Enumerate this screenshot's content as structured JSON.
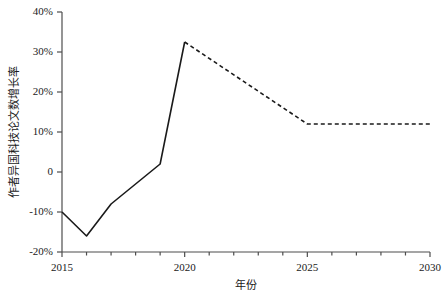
{
  "chart_data": {
    "type": "line",
    "title": "",
    "xlabel": "年份",
    "ylabel": "作者异国科技论文数增长率",
    "xlim": [
      2015,
      2030
    ],
    "ylim": [
      -20,
      40
    ],
    "grid": false,
    "legend": "none",
    "background_color": "#ffffff",
    "line_color": "#1a1a1a",
    "axis_color": "#4d4d4d",
    "xticks": [
      2015,
      2020,
      2025,
      2030
    ],
    "xtick_labels": [
      "2015",
      "2020",
      "2025",
      "2030"
    ],
    "xminor_tick_step": 1,
    "yticks": [
      -20,
      -10,
      0,
      10,
      20,
      30,
      40
    ],
    "ytick_labels": [
      "-20%",
      "-10%",
      "0",
      "10%",
      "20%",
      "30%",
      "40%"
    ],
    "series": [
      {
        "name": "历史",
        "style": "solid",
        "x": [
          2015,
          2016,
          2017,
          2019,
          2020
        ],
        "values": [
          -10,
          -16,
          -8,
          2,
          32.5
        ]
      },
      {
        "name": "预测",
        "style": "dashed",
        "x": [
          2020,
          2025,
          2030
        ],
        "values": [
          32.5,
          12,
          12
        ]
      }
    ]
  }
}
